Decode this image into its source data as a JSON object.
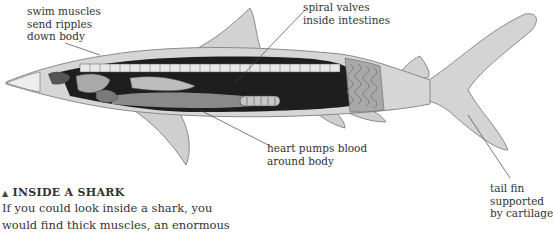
{
  "diagram": {
    "labels": {
      "swim_muscles": [
        "swim muscles",
        "send ripples",
        "down body"
      ],
      "spiral_valves": [
        "spiral valves",
        "inside intestines"
      ],
      "heart": [
        "heart pumps blood",
        "around body"
      ],
      "tail_fin": [
        "tail fin",
        "supported",
        "by cartilage"
      ]
    },
    "caption": {
      "marker": "▲",
      "title": "INSIDE A SHARK",
      "lines": [
        "If you could look inside a shark, you",
        "would find thick muscles, an enormous"
      ]
    },
    "colors": {
      "skin": "#d4d4d4",
      "skin_outline": "#8a8a8a",
      "cavity": "#1c1c1c",
      "muscle": "#9a9a9a",
      "text": "#333333"
    }
  }
}
